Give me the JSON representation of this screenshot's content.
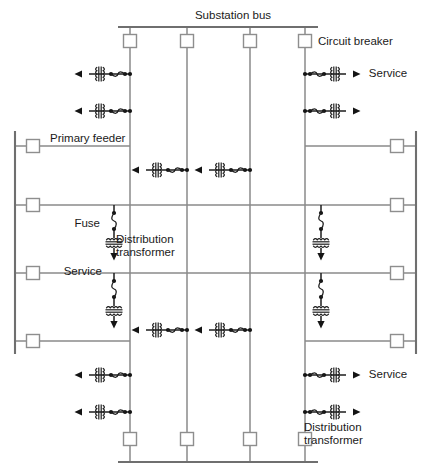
{
  "diagram": {
    "canvas": {
      "width": 432,
      "height": 475
    },
    "colors": {
      "bus": "#6f6f6f",
      "feeder": "#8a8a8a",
      "tap": "#9a9a9a",
      "symbol": "#1d1d1d",
      "breaker_fill": "#ffffff",
      "breaker_stroke": "#8e8e8e",
      "text": "#1a1a1a",
      "background": "#ffffff"
    },
    "labels": [
      {
        "id": "substation-bus",
        "text": "Substation bus",
        "x": 233,
        "y": 16,
        "anchor": "middle"
      },
      {
        "id": "circuit-breaker",
        "text": "Circuit breaker",
        "x": 318,
        "y": 42,
        "anchor": "start"
      },
      {
        "id": "service-top-right",
        "text": "Service",
        "x": 388,
        "y": 74,
        "anchor": "middle"
      },
      {
        "id": "primary-feeder",
        "text": "Primary feeder",
        "x": 50,
        "y": 139,
        "anchor": "start"
      },
      {
        "id": "fuse",
        "text": "Fuse",
        "x": 100,
        "y": 224,
        "anchor": "end"
      },
      {
        "id": "distribution-transformer-1",
        "text": "Distribution",
        "x": 116,
        "y": 240,
        "anchor": "start"
      },
      {
        "id": "distribution-transformer-2",
        "text": "transformer",
        "x": 116,
        "y": 253,
        "anchor": "start"
      },
      {
        "id": "service-mid-left",
        "text": "Service",
        "x": 102,
        "y": 272,
        "anchor": "end"
      },
      {
        "id": "service-bottom-right",
        "text": "Service",
        "x": 388,
        "y": 375,
        "anchor": "middle"
      },
      {
        "id": "distribution-transformer-3",
        "text": "Distribution",
        "x": 304,
        "y": 428,
        "anchor": "start"
      },
      {
        "id": "distribution-transformer-4",
        "text": "transformer",
        "x": 304,
        "y": 441,
        "anchor": "start"
      }
    ],
    "buses": [
      {
        "id": "substation-bus-top",
        "orientation": "horizontal",
        "x1": 118,
        "y1": 27,
        "x2": 318,
        "y2": 27
      },
      {
        "id": "substation-bus-bottom",
        "orientation": "horizontal",
        "x1": 118,
        "y1": 462,
        "x2": 318,
        "y2": 462
      },
      {
        "id": "primary-bus-left",
        "orientation": "vertical",
        "x1": 15,
        "y1": 131,
        "x2": 15,
        "y2": 354
      },
      {
        "id": "primary-bus-right",
        "orientation": "vertical",
        "x1": 416,
        "y1": 131,
        "x2": 416,
        "y2": 354
      }
    ],
    "vertical_feeders": [
      {
        "id": "feeder-1",
        "x": 130,
        "y1": 27,
        "y2": 462
      },
      {
        "id": "feeder-2",
        "x": 187,
        "y1": 27,
        "y2": 462
      },
      {
        "id": "feeder-3",
        "x": 250,
        "y1": 27,
        "y2": 462
      },
      {
        "id": "feeder-4",
        "x": 305,
        "y1": 27,
        "y2": 462
      }
    ],
    "horizontal_feeders": [
      {
        "id": "lateral-1",
        "y": 146,
        "x1": 15,
        "x2": 130
      },
      {
        "id": "lateral-2",
        "y": 146,
        "x1": 305,
        "x2": 416
      },
      {
        "id": "lateral-3",
        "y": 205,
        "x1": 15,
        "x2": 416
      },
      {
        "id": "lateral-4",
        "y": 273,
        "x1": 15,
        "x2": 416
      },
      {
        "id": "lateral-5",
        "y": 341,
        "x1": 15,
        "x2": 130
      },
      {
        "id": "lateral-6",
        "y": 341,
        "x1": 305,
        "x2": 416
      }
    ],
    "circuit_breakers": [
      {
        "id": "cb-top-1",
        "cx": 130,
        "cy": 41
      },
      {
        "id": "cb-top-2",
        "cx": 187,
        "cy": 41
      },
      {
        "id": "cb-top-3",
        "cx": 250,
        "cy": 41
      },
      {
        "id": "cb-top-4",
        "cx": 305,
        "cy": 41
      },
      {
        "id": "cb-bottom-1",
        "cx": 130,
        "cy": 439
      },
      {
        "id": "cb-bottom-2",
        "cx": 187,
        "cy": 439
      },
      {
        "id": "cb-bottom-3",
        "cx": 250,
        "cy": 439
      },
      {
        "id": "cb-bottom-4",
        "cx": 305,
        "cy": 439
      },
      {
        "id": "cb-left-1",
        "cx": 33,
        "cy": 146
      },
      {
        "id": "cb-left-2",
        "cx": 33,
        "cy": 205
      },
      {
        "id": "cb-left-3",
        "cx": 33,
        "cy": 273
      },
      {
        "id": "cb-left-4",
        "cx": 33,
        "cy": 341
      },
      {
        "id": "cb-right-1",
        "cx": 397,
        "cy": 146
      },
      {
        "id": "cb-right-2",
        "cx": 397,
        "cy": 205
      },
      {
        "id": "cb-right-3",
        "cx": 397,
        "cy": 273
      },
      {
        "id": "cb-right-4",
        "cx": 397,
        "cy": 341
      }
    ],
    "horizontal_service_taps": [
      {
        "id": "tap-top-left-1",
        "x": 130,
        "y": 74,
        "direction": "left"
      },
      {
        "id": "tap-top-left-2",
        "x": 130,
        "y": 111,
        "direction": "left"
      },
      {
        "id": "tap-top-right-1",
        "x": 305,
        "y": 74,
        "direction": "right"
      },
      {
        "id": "tap-top-right-2",
        "x": 305,
        "y": 111,
        "direction": "right"
      },
      {
        "id": "tap-mid-upper-1",
        "x": 187,
        "y": 170,
        "direction": "left"
      },
      {
        "id": "tap-mid-upper-2",
        "x": 250,
        "y": 170,
        "direction": "left"
      },
      {
        "id": "tap-mid-lower-1",
        "x": 187,
        "y": 330,
        "direction": "left"
      },
      {
        "id": "tap-mid-lower-2",
        "x": 250,
        "y": 330,
        "direction": "left"
      },
      {
        "id": "tap-bottom-left-1",
        "x": 130,
        "y": 375,
        "direction": "left"
      },
      {
        "id": "tap-bottom-left-2",
        "x": 130,
        "y": 412,
        "direction": "left"
      },
      {
        "id": "tap-bottom-right-1",
        "x": 305,
        "y": 375,
        "direction": "right"
      },
      {
        "id": "tap-bottom-right-2",
        "x": 305,
        "y": 412,
        "direction": "right"
      }
    ],
    "vertical_service_drops": [
      {
        "id": "drop-left-upper",
        "x": 114,
        "y": 205
      },
      {
        "id": "drop-left-lower",
        "x": 114,
        "y": 273
      },
      {
        "id": "drop-right-upper",
        "x": 321,
        "y": 205
      },
      {
        "id": "drop-right-lower",
        "x": 321,
        "y": 273
      }
    ],
    "symbol_legend": {
      "circuit_breaker": "open square on a feeder",
      "fuse": "two dots joined by an s-curve",
      "distribution_transformer": "pair of scalloped coil windings",
      "service": "arrow terminating a lateral"
    }
  }
}
